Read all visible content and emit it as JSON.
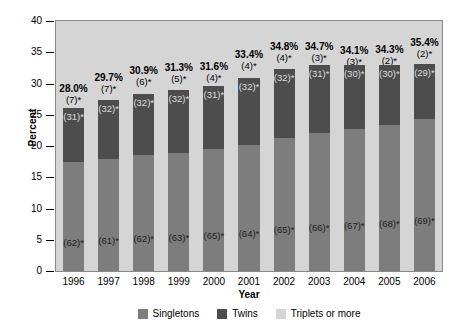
{
  "chart_data": {
    "type": "bar",
    "subtype": "stacked-bar",
    "title": "",
    "xlabel": "Year",
    "ylabel": "Percent",
    "ylim": [
      0,
      40
    ],
    "yticks": [
      0,
      5,
      10,
      15,
      20,
      25,
      30,
      35,
      40
    ],
    "grid": false,
    "legend_position": "bottom",
    "categories": [
      "1996",
      "1997",
      "1998",
      "1999",
      "2000",
      "2001",
      "2002",
      "2003",
      "2004",
      "2005",
      "2006"
    ],
    "series": [
      {
        "name": "Singletons",
        "color": "#7d7d7d",
        "values": [
          17.4,
          17.9,
          18.5,
          18.9,
          19.6,
          20.2,
          21.3,
          22.1,
          22.7,
          23.3,
          24.4
        ],
        "labels": [
          "(62)*",
          "(61)*",
          "(62)*",
          "(63)*",
          "(65)*",
          "(64)*",
          "(65)*",
          "(66)*",
          "(67)*",
          "(68)*",
          "(69)*"
        ]
      },
      {
        "name": "Twins",
        "color": "#4d4d4d",
        "values": [
          8.7,
          9.5,
          9.9,
          10.0,
          10.0,
          10.7,
          11.1,
          10.8,
          10.2,
          9.7,
          8.7
        ],
        "labels": [
          "(31)*",
          "(32)*",
          "(32)*",
          "(32)*",
          "(31)*",
          "(32)*",
          "(32)*",
          "(31)*",
          "(30)*",
          "(30)*",
          "(29)*"
        ]
      },
      {
        "name": "Triplets or more",
        "color": "#d5d5d5",
        "values": [
          1.9,
          2.3,
          2.5,
          2.4,
          2.0,
          2.5,
          2.4,
          1.8,
          1.2,
          1.3,
          2.3
        ],
        "labels": [
          "(7)*",
          "(7)*",
          "(6)*",
          "(5)*",
          "(4)*",
          "(4)*",
          "(4)*",
          "(3)*",
          "(3)*",
          "(2)*",
          "(2)*"
        ]
      }
    ],
    "totals": [
      "28.0%",
      "29.7%",
      "30.9%",
      "31.3%",
      "31.6%",
      "33.4%",
      "34.8%",
      "34.7%",
      "34.1%",
      "34.3%",
      "35.4%"
    ],
    "total_values": [
      28.0,
      29.7,
      30.9,
      31.3,
      31.6,
      33.4,
      34.8,
      34.7,
      34.1,
      34.3,
      35.4
    ]
  },
  "legend": {
    "items": [
      {
        "label": "Singletons",
        "color": "#7d7d7d"
      },
      {
        "label": "Twins",
        "color": "#4d4d4d"
      },
      {
        "label": "Triplets or more",
        "color": "#d5d5d5"
      }
    ]
  },
  "axes": {
    "y_title": "Percent",
    "x_title": "Year"
  },
  "colors": {
    "plot_background": "#d5d5d5",
    "page_background": "#ffffff",
    "axis": "#000000",
    "plot_border": "#8a8a8a"
  }
}
